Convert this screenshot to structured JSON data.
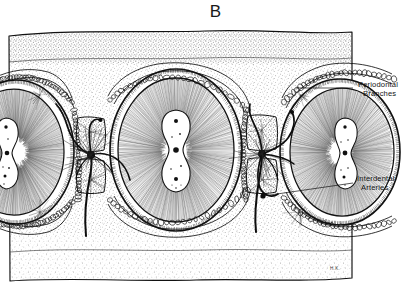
{
  "figure": {
    "letter": "B",
    "signature": "H.K.",
    "style": "pen-and-ink stipple line drawing",
    "ink_color": "#111111",
    "paper_color": "#ffffff"
  },
  "callouts": [
    {
      "name": "periodontal-branches",
      "line1": "Periodontal",
      "line2": "Branches",
      "leader": {
        "from_x": 353,
        "from_y": 88,
        "to_x": 296,
        "to_y": 88
      }
    },
    {
      "name": "interdental-arteries",
      "line1": "Interdental",
      "line2": "Arteries",
      "leader": {
        "from_x": 353,
        "from_y": 183,
        "to_x": 263,
        "to_y": 196
      }
    }
  ],
  "structures": {
    "alveolar_bone": "stippled cancellous bone block",
    "teeth_count": 3,
    "tooth_centers": [
      {
        "cx": 16,
        "cy": 152,
        "rx": 54,
        "ry": 68
      },
      {
        "cx": 176,
        "cy": 150,
        "rx": 62,
        "ry": 77
      },
      {
        "cx": 340,
        "cy": 152,
        "rx": 56,
        "ry": 69
      }
    ],
    "pulp_chambers": 3,
    "interdental_septa": 2,
    "vessel_nodes": [
      {
        "x": 91,
        "y": 155
      },
      {
        "x": 262,
        "y": 154
      }
    ]
  },
  "block": {
    "left": 8,
    "top": 30,
    "right": 353,
    "bottom": 281
  }
}
